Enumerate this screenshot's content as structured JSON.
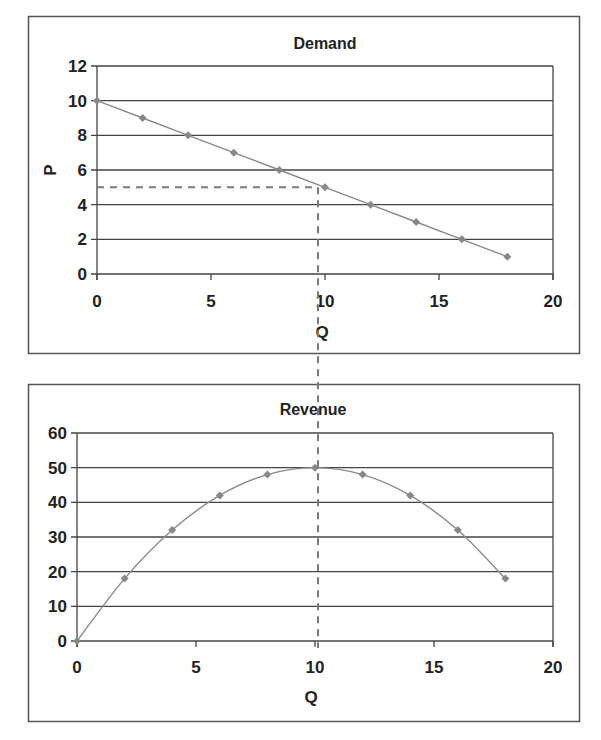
{
  "chart_data": [
    {
      "type": "line",
      "title": "Demand",
      "xlabel": "Q",
      "ylabel": "P",
      "xlim": [
        0,
        20
      ],
      "ylim": [
        0,
        12
      ],
      "x_ticks": [
        0,
        5,
        10,
        15,
        20
      ],
      "y_ticks": [
        0,
        2,
        4,
        6,
        8,
        10,
        12
      ],
      "grid": "horizontal",
      "legend": "none",
      "series": [
        {
          "name": "Demand",
          "x": [
            0,
            2,
            4,
            6,
            8,
            10,
            12,
            14,
            16,
            18
          ],
          "values": [
            10,
            9,
            8,
            7,
            6,
            5,
            4,
            3,
            2,
            1
          ]
        }
      ],
      "annotations": [
        {
          "type": "dashed-guide",
          "description": "Dashed lines from P=5 on the y-axis to the point (10,5) and down from Q=10 through the Revenue chart"
        }
      ]
    },
    {
      "type": "line",
      "title": "Revenue",
      "xlabel": "Q",
      "ylabel": "",
      "xlim": [
        0,
        20
      ],
      "ylim": [
        0,
        60
      ],
      "x_ticks": [
        0,
        5,
        10,
        15,
        20
      ],
      "y_ticks": [
        0,
        10,
        20,
        30,
        40,
        50,
        60
      ],
      "grid": "horizontal",
      "legend": "none",
      "series": [
        {
          "name": "Revenue",
          "x": [
            0,
            2,
            4,
            6,
            8,
            10,
            12,
            14,
            16,
            18
          ],
          "values": [
            0,
            18,
            32,
            42,
            48,
            50,
            48,
            42,
            32,
            18
          ]
        }
      ],
      "annotations": [
        {
          "type": "dashed-guide",
          "description": "Vertical dashed line at Q=10 marking maximum revenue of 50"
        }
      ]
    }
  ],
  "demand": {
    "title": "Demand",
    "xlabel": "Q",
    "ylabel": "P",
    "x_tick_labels": [
      "0",
      "5",
      "10",
      "15",
      "20"
    ],
    "y_tick_labels": [
      "0",
      "2",
      "4",
      "6",
      "8",
      "10",
      "12"
    ]
  },
  "revenue": {
    "title": "Revenue",
    "xlabel": "Q",
    "x_tick_labels": [
      "0",
      "5",
      "10",
      "15",
      "20"
    ],
    "y_tick_labels": [
      "0",
      "10",
      "20",
      "30",
      "40",
      "50",
      "60"
    ]
  },
  "colors": {
    "series_line": "#8a8a8a",
    "marker": "#888888",
    "grid": "#444444",
    "dashed_guide": "#7a7a7a"
  }
}
